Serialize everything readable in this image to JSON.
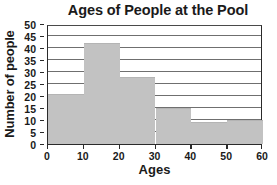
{
  "chart_data": {
    "type": "bar",
    "title": "Ages of People at the Pool",
    "xlabel": "Ages",
    "ylabel": "Number of people",
    "categories": [
      "0-10",
      "10-20",
      "20-30",
      "30-40",
      "40-50",
      "50-60"
    ],
    "bin_edges": [
      0,
      10,
      20,
      30,
      40,
      50,
      60
    ],
    "values": [
      21,
      42,
      28,
      15,
      9,
      10
    ],
    "xlim": [
      0,
      60
    ],
    "ylim": [
      0,
      50
    ],
    "xticks": [
      "0",
      "10",
      "20",
      "30",
      "40",
      "50",
      "60"
    ],
    "xtick_values": [
      0,
      10,
      20,
      30,
      40,
      50,
      60
    ],
    "yticks": [
      "0",
      "5",
      "10",
      "15",
      "20",
      "25",
      "30",
      "35",
      "40",
      "45",
      "50"
    ],
    "ytick_values": [
      0,
      5,
      10,
      15,
      20,
      25,
      30,
      35,
      40,
      45,
      50
    ],
    "grid": true,
    "grid_axis": "y",
    "legend": null,
    "bar_color": "#c2c2c2",
    "axis_color": "#2a2a2a",
    "grid_color": "#6f6f6f",
    "background": "#ffffff"
  }
}
